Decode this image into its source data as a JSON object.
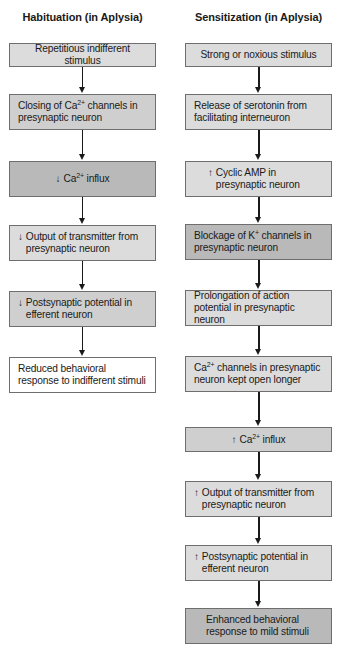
{
  "habituation": {
    "title": "Habituation (in Aplysia)",
    "steps": [
      {
        "text": "Repetitious indifferent stimulus",
        "indicator": ""
      },
      {
        "text_pre": "Closing of Ca",
        "sup": "2+",
        "text_post": " channels in presynaptic neuron",
        "indicator": ""
      },
      {
        "text_pre": "Ca",
        "sup": "2+",
        "text_post": " influx",
        "indicator": "↓"
      },
      {
        "text": "Output of transmitter from presynaptic neuron",
        "indicator": "↓"
      },
      {
        "text": "Postsynaptic potential in efferent neuron",
        "indicator": "↓"
      },
      {
        "text": "Reduced behavioral response to indifferent stimuli",
        "indicator": ""
      }
    ]
  },
  "sensitization": {
    "title": "Sensitization (in Aplysia)",
    "steps": [
      {
        "text": "Strong or noxious stimulus",
        "indicator": ""
      },
      {
        "text": "Release of serotonin from facilitating interneuron",
        "indicator": ""
      },
      {
        "text": "Cyclic AMP in presynaptic neuron",
        "indicator": "↑"
      },
      {
        "text_pre": "Blockage of K",
        "sup": "+",
        "text_post": " channels in presynaptic neuron",
        "indicator": ""
      },
      {
        "text": "Prolongation of action potential in presynaptic neuron",
        "indicator": ""
      },
      {
        "text_pre": "Ca",
        "sup": "2+",
        "text_post": " channels in presynaptic neuron kept open longer",
        "indicator": ""
      },
      {
        "text_pre": "Ca",
        "sup": "2+",
        "text_post": " influx",
        "indicator": "↑"
      },
      {
        "text": "Output of transmitter from presynaptic neuron",
        "indicator": "↑"
      },
      {
        "text": "Postsynaptic potential in efferent neuron",
        "indicator": "↑"
      },
      {
        "text": "Enhanced behavioral response to mild stimuli",
        "indicator": ""
      }
    ]
  },
  "colors": {
    "light_fill": "#dcdcdc",
    "mid_fill": "#cfcfcf",
    "dark_fill": "#b9b9b9",
    "white_fill": "#ffffff",
    "border": "#6e6e6e",
    "arrow": "#1a1a1a"
  }
}
